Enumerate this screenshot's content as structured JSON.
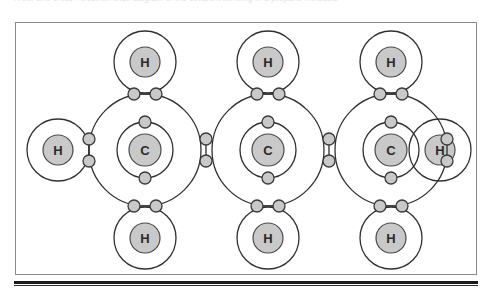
{
  "page": {
    "cut_text": "A dot-and-cross / electron shell diagram of the covalent bonding in a propane molecule",
    "bottom_rule": true
  },
  "figure": {
    "name": "propane-electron-shell-diagram",
    "molecule": "C3H8",
    "molecule_name": "propane",
    "frame": {
      "x": 15,
      "y": 22,
      "width": 462,
      "height": 253
    },
    "colors": {
      "frame_stroke": "#8a8a8a",
      "shell_stroke": "#303030",
      "nucleus_fill": "#c9c9c9",
      "nucleus_stroke": "#4a4a4a",
      "electron_fill": "#c9c9c9",
      "electron_stroke": "#3a3a3a",
      "label_color": "#2b2b2b",
      "rule_color": "#1a1a1a",
      "background": "#ffffff"
    },
    "geometry": {
      "carbon_nucleus_r": 16,
      "carbon_inner_shell_r": 28,
      "carbon_outer_shell_r": 56,
      "hydrogen_nucleus_r": 15,
      "hydrogen_shell_r": 31,
      "electron_r": 6,
      "carbon_spacing": 123,
      "vertical_bond_offset": 56
    },
    "atoms": [
      {
        "id": "C1",
        "label": "C",
        "element": "carbon",
        "cx": 145,
        "cy": 150,
        "type": "carbon"
      },
      {
        "id": "C2",
        "label": "C",
        "element": "carbon",
        "cx": 268,
        "cy": 150,
        "type": "carbon"
      },
      {
        "id": "C3",
        "label": "C",
        "element": "carbon",
        "cx": 391,
        "cy": 150,
        "type": "carbon"
      },
      {
        "id": "H1",
        "label": "H",
        "element": "hydrogen",
        "cx": 145,
        "cy": 62,
        "type": "hydrogen",
        "position": "top-left-carbon"
      },
      {
        "id": "H2",
        "label": "H",
        "element": "hydrogen",
        "cx": 268,
        "cy": 62,
        "type": "hydrogen",
        "position": "top-middle-carbon"
      },
      {
        "id": "H3",
        "label": "H",
        "element": "hydrogen",
        "cx": 391,
        "cy": 62,
        "type": "hydrogen",
        "position": "top-right-carbon"
      },
      {
        "id": "H4",
        "label": "H",
        "element": "hydrogen",
        "cx": 145,
        "cy": 238,
        "type": "hydrogen",
        "position": "bottom-left-carbon"
      },
      {
        "id": "H5",
        "label": "H",
        "element": "hydrogen",
        "cx": 268,
        "cy": 238,
        "type": "hydrogen",
        "position": "bottom-middle-carbon"
      },
      {
        "id": "H6",
        "label": "H",
        "element": "hydrogen",
        "cx": 391,
        "cy": 238,
        "type": "hydrogen",
        "position": "bottom-right-carbon"
      },
      {
        "id": "H7",
        "label": "H",
        "element": "hydrogen",
        "cx": 58,
        "cy": 150,
        "type": "hydrogen",
        "position": "left-terminal"
      },
      {
        "id": "H8",
        "label": "H",
        "element": "hydrogen",
        "cx": 440,
        "cy": 150,
        "type": "hydrogen",
        "position": "right-terminal"
      }
    ],
    "bonds": [
      {
        "id": "b1",
        "from": "C1",
        "to": "H1",
        "orientation": "vertical",
        "x": 145,
        "y": 94,
        "label": "C-H"
      },
      {
        "id": "b2",
        "from": "C2",
        "to": "H2",
        "orientation": "vertical",
        "x": 268,
        "y": 94,
        "label": "C-H"
      },
      {
        "id": "b3",
        "from": "C3",
        "to": "H3",
        "orientation": "vertical",
        "x": 391,
        "y": 94,
        "label": "C-H"
      },
      {
        "id": "b4",
        "from": "C1",
        "to": "H4",
        "orientation": "vertical",
        "x": 145,
        "y": 206,
        "label": "C-H"
      },
      {
        "id": "b5",
        "from": "C2",
        "to": "H5",
        "orientation": "vertical",
        "x": 268,
        "y": 206,
        "label": "C-H"
      },
      {
        "id": "b6",
        "from": "C3",
        "to": "H6",
        "orientation": "vertical",
        "x": 391,
        "y": 206,
        "label": "C-H"
      },
      {
        "id": "b7",
        "from": "C1",
        "to": "H7",
        "orientation": "horizontal",
        "x": 89,
        "y": 150,
        "label": "C-H"
      },
      {
        "id": "b8",
        "from": "C3",
        "to": "H8",
        "orientation": "horizontal",
        "x": 447,
        "y": 150,
        "label": "C-H"
      },
      {
        "id": "b9",
        "from": "C1",
        "to": "C2",
        "orientation": "horizontal",
        "x": 206,
        "y": 150,
        "label": "C-C"
      },
      {
        "id": "b10",
        "from": "C2",
        "to": "C3",
        "orientation": "horizontal",
        "x": 329,
        "y": 150,
        "label": "C-C"
      }
    ],
    "inner_shell_electrons": [
      {
        "id": "e-c1-top",
        "atom": "C1",
        "cx": 145,
        "cy": 122
      },
      {
        "id": "e-c1-bottom",
        "atom": "C1",
        "cx": 145,
        "cy": 178
      },
      {
        "id": "e-c2-top",
        "atom": "C2",
        "cx": 268,
        "cy": 122
      },
      {
        "id": "e-c2-bottom",
        "atom": "C2",
        "cx": 268,
        "cy": 178
      },
      {
        "id": "e-c3-top",
        "atom": "C3",
        "cx": 391,
        "cy": 122
      },
      {
        "id": "e-c3-bottom",
        "atom": "C3",
        "cx": 391,
        "cy": 178
      }
    ]
  }
}
